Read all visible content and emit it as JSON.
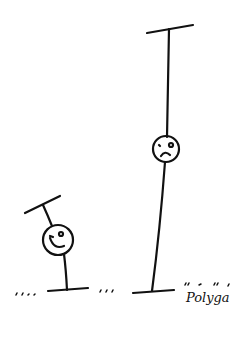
{
  "illustration": {
    "description": "Hand-drawn cartoon: a short smiling figure with a tilted bar on top and a tall frowning figure stretched between two bars",
    "signature": "Polyga",
    "figures": [
      {
        "name": "short-figure",
        "expression": "smiling"
      },
      {
        "name": "tall-figure",
        "expression": "frowning"
      }
    ],
    "ink_color": "#111111",
    "background": "#ffffff"
  }
}
